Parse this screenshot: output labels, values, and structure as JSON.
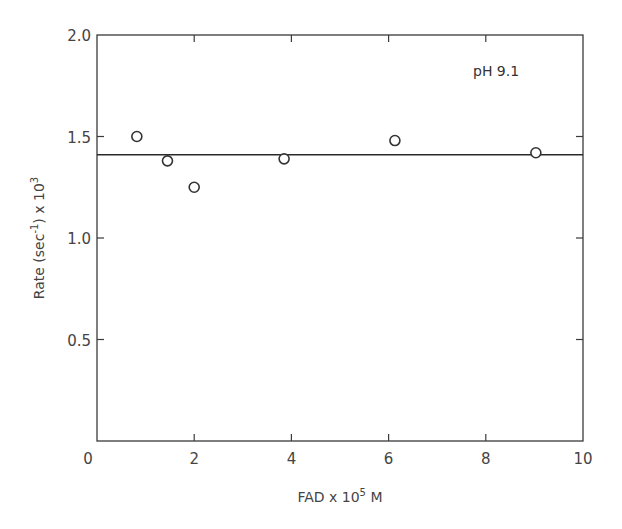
{
  "chart_data": {
    "type": "scatter",
    "title": "",
    "annotation": "pH  9.1",
    "xlabel": "FAD x 10^5 M",
    "xlabel_parts": {
      "base": "FAD x 10",
      "sup": "5",
      "tail": " M"
    },
    "ylabel": "Rate (sec^-1) x 10^3",
    "ylabel_parts": {
      "pre": "Rate  (sec",
      "sup1": "-1",
      "mid": ")  x 10",
      "sup2": "3"
    },
    "xlim": [
      0,
      10
    ],
    "ylim": [
      0,
      2.0
    ],
    "x_ticks": [
      0,
      2,
      4,
      6,
      8,
      10
    ],
    "x_tick_labels": [
      "0",
      "2",
      "4",
      "6",
      "8",
      "10"
    ],
    "y_ticks": [
      0.5,
      1.0,
      1.5,
      2.0
    ],
    "y_tick_labels": [
      "0.5",
      "1.0",
      "1.5",
      "2.0"
    ],
    "grid": false,
    "legend": null,
    "series": [
      {
        "name": "Rate",
        "marker": "open-circle",
        "x": [
          0.82,
          1.45,
          2.0,
          3.85,
          6.13,
          9.03
        ],
        "y": [
          1.5,
          1.38,
          1.25,
          1.39,
          1.48,
          1.42
        ]
      },
      {
        "name": "Mean rate (fit line)",
        "type": "line",
        "x": [
          0,
          10
        ],
        "y": [
          1.41,
          1.41
        ]
      }
    ]
  }
}
